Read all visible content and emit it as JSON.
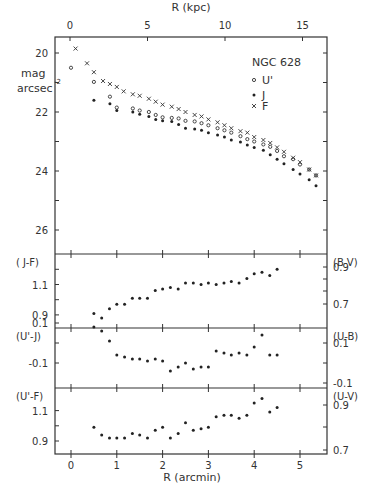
{
  "figure": {
    "object_label": "NGC 628",
    "top_axis_label": "R (kpc)",
    "bottom_axis_label": "R (arcmin)",
    "mag_ylabel_line1": "mag",
    "mag_ylabel_line2": "arcsec",
    "mag_ylabel_exp": "-2",
    "legend": [
      {
        "label": "U'",
        "marker": "open-circle"
      },
      {
        "label": "J",
        "marker": "filled-dot"
      },
      {
        "label": "F",
        "marker": "cross"
      }
    ],
    "panels": [
      {
        "left_label": "( J-F)",
        "right_label": "(B-V)"
      },
      {
        "left_label": "(U'-J)",
        "right_label": "(U-B)"
      },
      {
        "left_label": "(U'-F)",
        "right_label": "(U-V)"
      }
    ]
  },
  "chart_data": [
    {
      "type": "scatter",
      "title": "NGC 628",
      "xlabel": "R (arcmin)",
      "x2label": "R (kpc)",
      "ylabel": "mag arcsec^-2",
      "xlim": [
        -0.35,
        5.6
      ],
      "ylim": [
        19.45,
        26.8
      ],
      "y_inverted": true,
      "x_ticks": [
        0,
        1,
        2,
        3,
        4,
        5
      ],
      "x2_ticks": [
        0,
        5,
        10,
        15
      ],
      "y_ticks": [
        20,
        22,
        24,
        26
      ],
      "legend_position": "upper right",
      "series": [
        {
          "name": "U'",
          "marker": "open-circle",
          "x": [
            0.0,
            0.5,
            0.85,
            1.0,
            1.35,
            1.5,
            1.7,
            1.85,
            2.0,
            2.2,
            2.35,
            2.5,
            2.7,
            2.85,
            3.0,
            3.2,
            3.35,
            3.5,
            3.7,
            3.85,
            4.0,
            4.2,
            4.35,
            4.5,
            4.65,
            4.85,
            5.0,
            5.2,
            5.35
          ],
          "y": [
            20.5,
            20.98,
            21.48,
            21.85,
            21.88,
            21.95,
            22.0,
            22.1,
            22.18,
            22.2,
            22.22,
            22.3,
            22.32,
            22.38,
            22.45,
            22.55,
            22.62,
            22.7,
            22.82,
            22.92,
            23.0,
            23.1,
            23.18,
            23.32,
            23.5,
            23.6,
            23.78,
            23.95,
            24.15
          ]
        },
        {
          "name": "J",
          "marker": "filled-dot",
          "x": [
            0.5,
            0.85,
            1.0,
            1.35,
            1.5,
            1.7,
            1.85,
            2.0,
            2.2,
            2.35,
            2.5,
            2.7,
            2.85,
            3.0,
            3.2,
            3.35,
            3.5,
            3.7,
            3.85,
            4.0,
            4.2,
            4.35,
            4.5,
            4.65,
            4.85,
            5.0,
            5.2,
            5.35
          ],
          "y": [
            21.6,
            21.72,
            21.95,
            22.0,
            22.08,
            22.15,
            22.25,
            22.3,
            22.32,
            22.42,
            22.55,
            22.58,
            22.62,
            22.7,
            22.78,
            22.85,
            22.95,
            23.02,
            23.12,
            23.2,
            23.3,
            23.45,
            23.6,
            23.75,
            23.95,
            24.1,
            24.3,
            24.5
          ]
        },
        {
          "name": "F",
          "marker": "cross",
          "x": [
            0.1,
            0.35,
            0.5,
            0.7,
            0.85,
            1.0,
            1.15,
            1.35,
            1.5,
            1.7,
            1.85,
            2.0,
            2.2,
            2.35,
            2.5,
            2.7,
            2.85,
            3.0,
            3.2,
            3.35,
            3.5,
            3.7,
            3.85,
            4.0,
            4.2,
            4.35,
            4.5,
            4.65,
            4.85,
            5.0,
            5.2,
            5.35
          ],
          "y": [
            19.85,
            20.35,
            20.65,
            20.95,
            21.05,
            21.15,
            21.3,
            21.4,
            21.45,
            21.55,
            21.65,
            21.75,
            21.82,
            21.9,
            22.0,
            22.1,
            22.15,
            22.25,
            22.35,
            22.45,
            22.55,
            22.65,
            22.7,
            22.85,
            22.95,
            23.05,
            23.2,
            23.35,
            23.55,
            23.7,
            23.95,
            24.15
          ]
        }
      ]
    },
    {
      "type": "scatter",
      "ylabel": "(J-F)",
      "y2label": "(B-V)",
      "ylim": [
        0.82,
        1.27
      ],
      "y_ticks": [
        0.9,
        1.1
      ],
      "y2_ticks": [
        0.7,
        0.9
      ],
      "series": [
        {
          "name": "J-F",
          "marker": "filled-dot",
          "x": [
            0.5,
            0.67,
            0.84,
            1.0,
            1.17,
            1.34,
            1.5,
            1.67,
            1.84,
            2.0,
            2.17,
            2.34,
            2.5,
            2.67,
            2.84,
            3.0,
            3.17,
            3.34,
            3.5,
            3.67,
            3.84,
            4.0,
            4.17,
            4.34,
            4.5
          ],
          "y": [
            0.91,
            0.88,
            0.94,
            0.97,
            0.97,
            1.01,
            1.01,
            1.01,
            1.06,
            1.07,
            1.08,
            1.07,
            1.11,
            1.11,
            1.1,
            1.11,
            1.1,
            1.11,
            1.12,
            1.11,
            1.14,
            1.17,
            1.18,
            1.16,
            1.2
          ]
        }
      ]
    },
    {
      "type": "scatter",
      "ylabel": "(U'-J)",
      "y2label": "(U-B)",
      "ylim": [
        -0.17,
        0.19
      ],
      "y_ticks": [
        -0.1,
        0.1
      ],
      "y2_ticks": [
        -0.1,
        0.1
      ],
      "series": [
        {
          "name": "U'-J",
          "marker": "filled-dot",
          "x": [
            0.5,
            0.67,
            0.84,
            1.0,
            1.17,
            1.34,
            1.5,
            1.67,
            1.84,
            2.0,
            2.17,
            2.34,
            2.5,
            2.67,
            2.84,
            3.0,
            3.17,
            3.34,
            3.5,
            3.67,
            3.84,
            4.0,
            4.17,
            4.34,
            4.5
          ],
          "y": [
            0.08,
            0.06,
            0.01,
            -0.06,
            -0.07,
            -0.08,
            -0.08,
            -0.09,
            -0.08,
            -0.09,
            -0.14,
            -0.12,
            -0.1,
            -0.13,
            -0.12,
            -0.12,
            -0.04,
            -0.05,
            -0.06,
            -0.05,
            -0.06,
            -0.02,
            0.04,
            -0.06,
            -0.06
          ]
        }
      ]
    },
    {
      "type": "scatter",
      "ylabel": "(U'-F)",
      "y2label": "(U-V)",
      "ylim": [
        0.82,
        1.27
      ],
      "y_ticks": [
        0.9,
        1.1
      ],
      "y2_ticks": [
        0.7,
        0.9
      ],
      "series": [
        {
          "name": "U'-F",
          "marker": "filled-dot",
          "x": [
            0.5,
            0.67,
            0.84,
            1.0,
            1.17,
            1.34,
            1.5,
            1.67,
            1.84,
            2.0,
            2.17,
            2.34,
            2.5,
            2.67,
            2.84,
            3.0,
            3.17,
            3.34,
            3.5,
            3.67,
            3.84,
            4.0,
            4.17,
            4.34,
            4.5
          ],
          "y": [
            0.99,
            0.94,
            0.92,
            0.92,
            0.92,
            0.95,
            0.94,
            0.92,
            0.97,
            0.99,
            0.92,
            0.95,
            1.02,
            0.97,
            0.98,
            0.99,
            1.06,
            1.07,
            1.07,
            1.05,
            1.07,
            1.15,
            1.18,
            1.09,
            1.12
          ]
        }
      ]
    }
  ]
}
